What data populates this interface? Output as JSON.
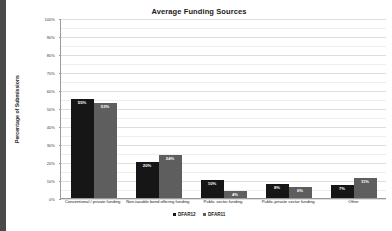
{
  "chart_data": {
    "type": "bar",
    "title": "Average Funding Sources",
    "xlabel": "",
    "ylabel": "Percentage of Submissions",
    "ylim": [
      0,
      100
    ],
    "ytick_labels": [
      "100%",
      "90%",
      "80%",
      "70%",
      "60%",
      "50%",
      "40%",
      "30%",
      "20%",
      "10%",
      "0%"
    ],
    "ytick_values": [
      100,
      90,
      80,
      70,
      60,
      50,
      40,
      30,
      20,
      10,
      0
    ],
    "grid": true,
    "legend_position": "bottom",
    "categories": [
      "Conventional / private funding",
      "Non-taxable bond offering funding",
      "Public sector funding",
      "Public-private sector funding",
      "Other"
    ],
    "series": [
      {
        "name": "DFAR12",
        "color": "#161616",
        "values": [
          55,
          20,
          10,
          8,
          7
        ],
        "data_labels": [
          "55%",
          "20%",
          "10%",
          "8%",
          "7%"
        ]
      },
      {
        "name": "DFAR11",
        "color": "#5e5e5e",
        "values": [
          53,
          24,
          4,
          6,
          11
        ],
        "data_labels": [
          "53%",
          "24%",
          "4%",
          "6%",
          "11%"
        ]
      }
    ]
  }
}
